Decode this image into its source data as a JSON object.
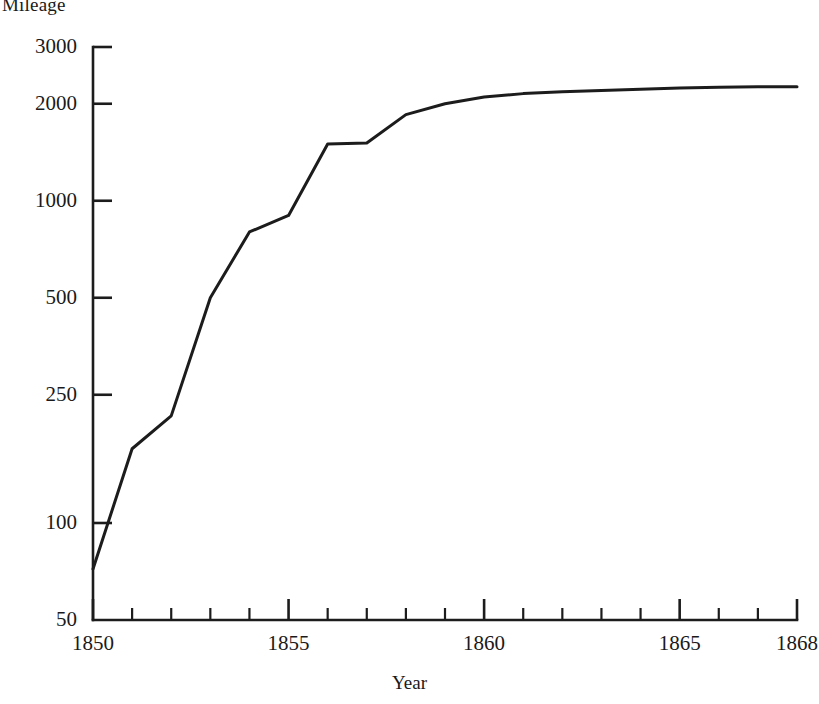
{
  "chart_data": {
    "type": "line",
    "title": "",
    "ylabel": "Mileage",
    "xlabel": "Year",
    "yscale": "log",
    "ylim": [
      50,
      3000
    ],
    "xlim": [
      1850,
      1868
    ],
    "grid": false,
    "legend": null,
    "ytick_labels": [
      "3000",
      "2000",
      "1000",
      "500",
      "250",
      "100",
      "50"
    ],
    "ytick_values": [
      3000,
      2000,
      1000,
      500,
      250,
      100,
      50
    ],
    "xtick_labels": [
      "1850",
      "1855",
      "1860",
      "1865",
      "1868"
    ],
    "xtick_values": [
      1850,
      1855,
      1860,
      1865,
      1868
    ],
    "xtick_minor_values": [
      1851,
      1852,
      1853,
      1854,
      1856,
      1857,
      1858,
      1859,
      1861,
      1862,
      1863,
      1864,
      1866,
      1867
    ],
    "x": [
      1850,
      1851,
      1852,
      1853,
      1854,
      1855,
      1856,
      1857,
      1858,
      1859,
      1860,
      1861,
      1862,
      1863,
      1864,
      1865,
      1866,
      1867,
      1868
    ],
    "values": [
      72,
      170,
      215,
      500,
      800,
      900,
      1500,
      1510,
      1850,
      2000,
      2100,
      2150,
      2180,
      2200,
      2220,
      2240,
      2250,
      2260,
      2260
    ],
    "series": [
      {
        "name": "Mileage",
        "values": [
          72,
          170,
          215,
          500,
          800,
          900,
          1500,
          1510,
          1850,
          2000,
          2100,
          2150,
          2180,
          2200,
          2220,
          2240,
          2250,
          2260,
          2260
        ]
      }
    ],
    "line_color": "#1c1c1c"
  }
}
